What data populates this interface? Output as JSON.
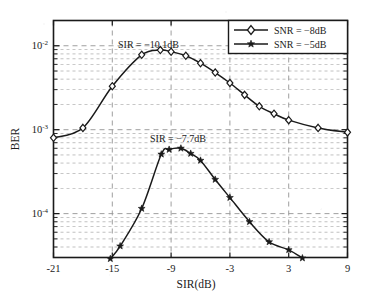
{
  "figure": {
    "background_color": "#ffffff",
    "axes_color": "#1a1a1a",
    "grid_color": "#9a9a9a",
    "curve_color": "#1a1a1a"
  },
  "axes": {
    "x": {
      "label": "SIR(dB)",
      "ticks": [
        "-21",
        "-15",
        "-9",
        "-3",
        "3",
        "9"
      ],
      "tick_values": [
        -21,
        -15,
        -9,
        -3,
        3,
        9
      ],
      "range": [
        -21,
        9
      ]
    },
    "y": {
      "label": "BER",
      "scale": "log",
      "ticks": [
        {
          "mantissa": "10",
          "exponent": "-2"
        },
        {
          "mantissa": "10",
          "exponent": "-3"
        },
        {
          "mantissa": "10",
          "exponent": "-4"
        }
      ],
      "range": [
        3e-05,
        0.02
      ]
    }
  },
  "legend": {
    "position": "top-right",
    "entries": [
      {
        "label": "SNR = −8dB",
        "marker": "open-diamond"
      },
      {
        "label": "SNR = −5dB",
        "marker": "filled-star"
      }
    ]
  },
  "annotations": [
    {
      "id": "annot-upper",
      "text": "SIR = −10.1dB",
      "x_value": -10.1,
      "series": "SNR = −8dB"
    },
    {
      "id": "annot-lower",
      "text": "SIR = −7.7dB",
      "x_value": -7.7,
      "series": "SNR = −5dB"
    }
  ],
  "chart_data": {
    "type": "line",
    "title": "",
    "xlabel": "SIR(dB)",
    "ylabel": "BER",
    "xlim": [
      -21,
      9
    ],
    "ylim": [
      3e-05,
      0.02
    ],
    "yscale": "log",
    "grid": true,
    "legend_position": "top-right",
    "annotations": [
      "SIR = −10.1dB",
      "SIR = −7.7dB"
    ],
    "series": [
      {
        "name": "SNR = −8dB",
        "marker": "open-diamond",
        "x": [
          -21,
          -18,
          -15,
          -12,
          -10.1,
          -9,
          -7.5,
          -6,
          -4.5,
          -3,
          -1.5,
          0,
          1.5,
          3,
          6,
          9
        ],
        "y": [
          0.0008,
          0.00105,
          0.0033,
          0.0078,
          0.0089,
          0.0085,
          0.0076,
          0.0062,
          0.0048,
          0.0036,
          0.0026,
          0.0019,
          0.00155,
          0.0013,
          0.00105,
          0.00093
        ]
      },
      {
        "name": "SNR = −5dB",
        "marker": "filled-star",
        "x": [
          -15.2,
          -14.2,
          -12.0,
          -10.0,
          -9.2,
          -8.0,
          -7.0,
          -6.0,
          -4.5,
          -3.0,
          -1.0,
          1.0,
          3.0,
          4.4
        ],
        "y": [
          2.9e-05,
          4.1e-05,
          0.000115,
          0.00051,
          0.00058,
          0.0006,
          0.00052,
          0.00043,
          0.000255,
          0.000155,
          8e-05,
          4.6e-05,
          3.7e-05,
          2.95e-05
        ]
      }
    ]
  }
}
